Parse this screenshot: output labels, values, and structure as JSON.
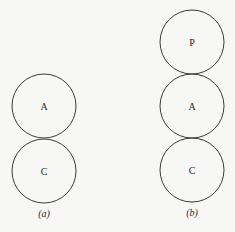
{
  "diagram": {
    "panels": [
      {
        "caption": "(a)",
        "circles": [
          {
            "label": "A"
          },
          {
            "label": "C"
          }
        ]
      },
      {
        "caption": "(b)",
        "circles": [
          {
            "label": "P"
          },
          {
            "label": "A"
          },
          {
            "label": "C"
          }
        ]
      }
    ],
    "colors": {
      "background": "#f7f7f5",
      "stroke": "#3a3a3a",
      "text": "#2a2a2a"
    }
  }
}
